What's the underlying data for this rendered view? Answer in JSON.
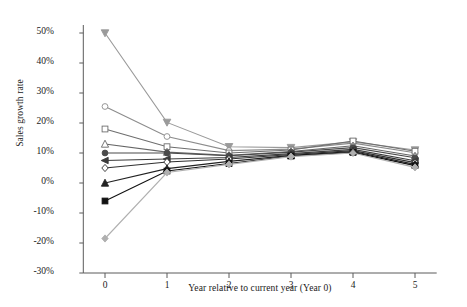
{
  "chart_data": {
    "type": "line",
    "title": "",
    "xlabel": "Year relative to current year (Year 0)",
    "ylabel": "Sales growth rate",
    "x": [
      0,
      1,
      2,
      3,
      4,
      5
    ],
    "xtick_labels": [
      "0",
      "1",
      "2",
      "3",
      "4",
      "5"
    ],
    "ytick_labels": [
      "50%",
      "40%",
      "30%",
      "20%",
      "10%",
      "0%",
      "-10%",
      "-20%",
      "-30%"
    ],
    "ytick_values": [
      0.5,
      0.4,
      0.3,
      0.2,
      0.1,
      0.0,
      -0.1,
      -0.2,
      -0.3
    ],
    "ylim": [
      -0.3,
      0.5
    ],
    "xlim": [
      -0.35,
      5.35
    ],
    "grid": false,
    "legend": "none",
    "yaxis_format": "percent",
    "series": [
      {
        "name": "decile-1-highest",
        "marker": "triangle-down",
        "fill": "solid",
        "color": "#9a9a9a",
        "values": [
          0.5,
          0.202,
          0.121,
          0.118,
          0.137,
          0.11
        ]
      },
      {
        "name": "decile-2",
        "marker": "circle",
        "fill": "open",
        "color": "#8c8c8c",
        "values": [
          0.255,
          0.155,
          0.108,
          0.113,
          0.133,
          0.101
        ]
      },
      {
        "name": "decile-3",
        "marker": "square",
        "fill": "open",
        "color": "#6e6e6e",
        "values": [
          0.18,
          0.121,
          0.1,
          0.11,
          0.14,
          0.106
        ]
      },
      {
        "name": "decile-4",
        "marker": "triangle-up",
        "fill": "open",
        "color": "#666666",
        "values": [
          0.13,
          0.103,
          0.092,
          0.105,
          0.124,
          0.09
        ]
      },
      {
        "name": "decile-5",
        "marker": "circle",
        "fill": "solid",
        "color": "#4a4a4a",
        "values": [
          0.1,
          0.1,
          0.091,
          0.103,
          0.118,
          0.084
        ]
      },
      {
        "name": "decile-6",
        "marker": "triangle-left",
        "fill": "solid",
        "color": "#3c3c3c",
        "values": [
          0.075,
          0.08,
          0.085,
          0.098,
          0.112,
          0.074
        ]
      },
      {
        "name": "decile-7",
        "marker": "diamond",
        "fill": "open",
        "color": "#303030",
        "values": [
          0.05,
          0.07,
          0.08,
          0.095,
          0.108,
          0.068
        ]
      },
      {
        "name": "decile-8",
        "marker": "triangle-up",
        "fill": "solid",
        "color": "#222222",
        "values": [
          0.0,
          0.048,
          0.072,
          0.092,
          0.105,
          0.062
        ]
      },
      {
        "name": "decile-9",
        "marker": "square",
        "fill": "solid",
        "color": "#111111",
        "values": [
          -0.06,
          0.04,
          0.065,
          0.09,
          0.102,
          0.058
        ]
      },
      {
        "name": "decile-10-lowest",
        "marker": "diamond",
        "fill": "solid",
        "color": "#b0b0b0",
        "values": [
          -0.185,
          0.035,
          0.062,
          0.088,
          0.1,
          0.052
        ]
      }
    ]
  }
}
